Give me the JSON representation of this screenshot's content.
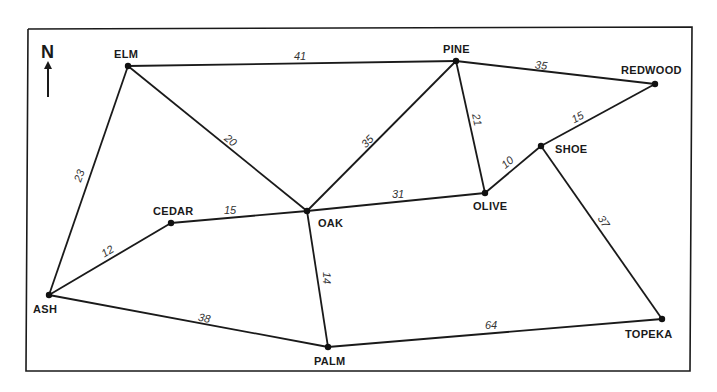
{
  "diagram": {
    "type": "weighted-graph",
    "compass": {
      "label": "N",
      "x": 48,
      "y": 58
    },
    "nodes": [
      {
        "id": "ELM",
        "label": "ELM",
        "x": 128,
        "y": 66,
        "lx": 114,
        "ly": 58
      },
      {
        "id": "PINE",
        "label": "PINE",
        "x": 456,
        "y": 61,
        "lx": 443,
        "ly": 53
      },
      {
        "id": "REDWOOD",
        "label": "REDWOOD",
        "x": 655,
        "y": 84,
        "lx": 621,
        "ly": 74
      },
      {
        "id": "SHOE",
        "label": "SHOE",
        "x": 541,
        "y": 146,
        "lx": 555,
        "ly": 153
      },
      {
        "id": "OLIVE",
        "label": "OLIVE",
        "x": 485,
        "y": 193,
        "lx": 473,
        "ly": 210
      },
      {
        "id": "OAK",
        "label": "OAK",
        "x": 307,
        "y": 211,
        "lx": 318,
        "ly": 227
      },
      {
        "id": "CEDAR",
        "label": "CEDAR",
        "x": 171,
        "y": 223,
        "lx": 153,
        "ly": 215
      },
      {
        "id": "ASH",
        "label": "ASH",
        "x": 49,
        "y": 295,
        "lx": 33,
        "ly": 313
      },
      {
        "id": "PALM",
        "label": "PALM",
        "x": 328,
        "y": 347,
        "lx": 314,
        "ly": 365
      },
      {
        "id": "TOPEKA",
        "label": "TOPEKA",
        "x": 662,
        "y": 319,
        "lx": 625,
        "ly": 338
      }
    ],
    "edges": [
      {
        "from": "ELM",
        "to": "PINE",
        "weight": "41",
        "wx": 300,
        "wy": 57,
        "rot": 0
      },
      {
        "from": "ELM",
        "to": "ASH",
        "weight": "23",
        "wx": 80,
        "wy": 176,
        "rot": -70
      },
      {
        "from": "ELM",
        "to": "OAK",
        "weight": "20",
        "wx": 230,
        "wy": 141,
        "rot": 38
      },
      {
        "from": "PINE",
        "to": "REDWOOD",
        "weight": "35",
        "wx": 541,
        "wy": 66,
        "rot": 7
      },
      {
        "from": "PINE",
        "to": "OAK",
        "weight": "35",
        "wx": 368,
        "wy": 142,
        "rot": -45
      },
      {
        "from": "PINE",
        "to": "OLIVE",
        "weight": "21",
        "wx": 476,
        "wy": 120,
        "rot": 78
      },
      {
        "from": "REDWOOD",
        "to": "SHOE",
        "weight": "15",
        "wx": 578,
        "wy": 118,
        "rot": -28
      },
      {
        "from": "SHOE",
        "to": "OLIVE",
        "weight": "10",
        "wx": 508,
        "wy": 163,
        "rot": -40
      },
      {
        "from": "SHOE",
        "to": "TOPEKA",
        "weight": "37",
        "wx": 603,
        "wy": 222,
        "rot": 56
      },
      {
        "from": "OLIVE",
        "to": "OAK",
        "weight": "31",
        "wx": 398,
        "wy": 195,
        "rot": 0
      },
      {
        "from": "OAK",
        "to": "CEDAR",
        "weight": "15",
        "wx": 230,
        "wy": 211,
        "rot": 0
      },
      {
        "from": "OAK",
        "to": "PALM",
        "weight": "14",
        "wx": 326,
        "wy": 278,
        "rot": 88
      },
      {
        "from": "CEDAR",
        "to": "ASH",
        "weight": "12",
        "wx": 108,
        "wy": 252,
        "rot": -32
      },
      {
        "from": "ASH",
        "to": "PALM",
        "weight": "38",
        "wx": 204,
        "wy": 319,
        "rot": 12
      },
      {
        "from": "PALM",
        "to": "TOPEKA",
        "weight": "64",
        "wx": 491,
        "wy": 326,
        "rot": 0
      }
    ]
  }
}
